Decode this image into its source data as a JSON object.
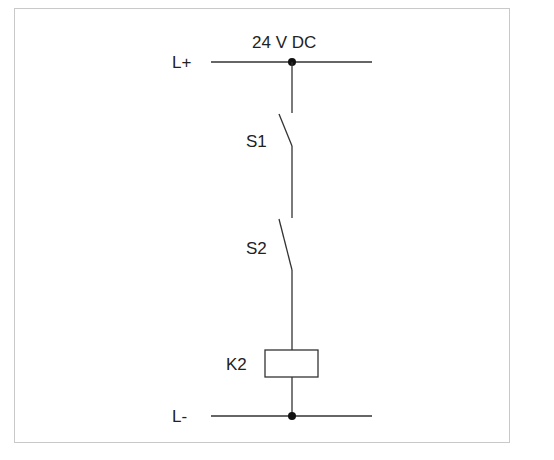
{
  "diagram": {
    "type": "circuit-schematic",
    "supply_label": "24 V DC",
    "rails": {
      "positive": "L+",
      "negative": "L-"
    },
    "components": [
      {
        "id": "S1",
        "label": "S1",
        "kind": "normally-open switch"
      },
      {
        "id": "S2",
        "label": "S2",
        "kind": "normally-open switch"
      },
      {
        "id": "K2",
        "label": "K2",
        "kind": "relay coil"
      }
    ],
    "colors": {
      "line": "#333333",
      "frame": "#c9c9c9",
      "background": "#ffffff"
    }
  }
}
